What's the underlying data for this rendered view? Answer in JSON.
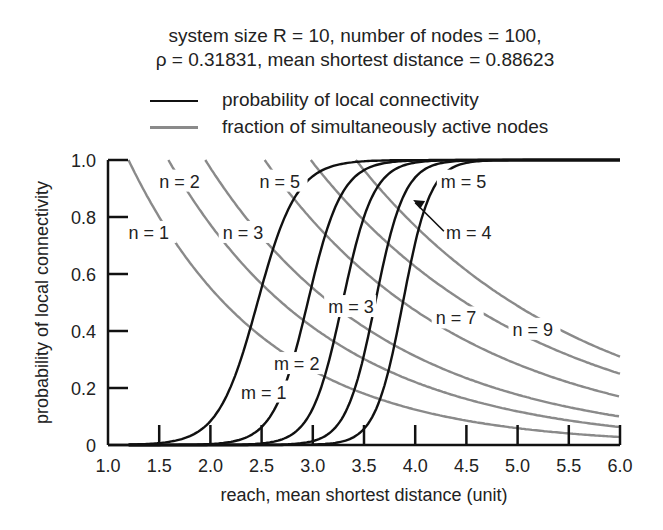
{
  "chart_data": {
    "type": "line",
    "title": "system size R = 10, number of nodes = 100,",
    "subtitle": "ρ = 0.31831, mean shortest distance = 0.88623",
    "xlabel": "reach, mean shortest distance (unit)",
    "ylabel": "probability of local connectivity",
    "xlim": [
      1.0,
      6.0
    ],
    "ylim": [
      0,
      1.0
    ],
    "xticks": [
      "1.0",
      "1.5",
      "2.0",
      "2.5",
      "3.0",
      "3.5",
      "4.0",
      "4.5",
      "5.0",
      "5.5",
      "6.0"
    ],
    "yticks": [
      "0",
      "0.2",
      "0.4",
      "0.6",
      "0.8",
      "1.0"
    ],
    "grid": false,
    "legend": [
      {
        "label": "probability of local connectivity",
        "color": "#111111"
      },
      {
        "label": "fraction of simultaneously active nodes",
        "color": "#8a8a8a"
      }
    ],
    "series_connectivity": [
      {
        "name": "m = 1",
        "midpoint": 2.46,
        "steep": 5.2
      },
      {
        "name": "m = 2",
        "midpoint": 2.95,
        "steep": 6.0
      },
      {
        "name": "m = 3",
        "midpoint": 3.29,
        "steep": 6.6
      },
      {
        "name": "m = 4",
        "midpoint": 3.61,
        "steep": 7.0
      },
      {
        "name": "m = 5",
        "midpoint": 3.88,
        "steep": 7.4
      }
    ],
    "series_active": [
      {
        "name": "n = 1",
        "x_at_1": 1.2,
        "y_at_6": 0.028
      },
      {
        "name": "n = 2",
        "x_at_1": 1.59,
        "y_at_6": 0.063
      },
      {
        "name": "n = 3",
        "x_at_1": 1.95,
        "y_at_6": 0.1
      },
      {
        "name": "n = 5",
        "x_at_1": 2.53,
        "y_at_6": 0.17
      },
      {
        "name": "n = 7",
        "x_at_1": 2.98,
        "y_at_6": 0.25
      },
      {
        "name": "n = 9",
        "x_at_1": 3.42,
        "y_at_6": 0.31
      }
    ],
    "annotations": [
      {
        "text": "n = 1",
        "x": 1.2,
        "y": 0.73
      },
      {
        "text": "n = 2",
        "x": 1.5,
        "y": 0.91
      },
      {
        "text": "n = 3",
        "x": 2.12,
        "y": 0.73
      },
      {
        "text": "n = 5",
        "x": 2.48,
        "y": 0.91
      },
      {
        "text": "n = 7",
        "x": 4.2,
        "y": 0.43
      },
      {
        "text": "n = 9",
        "x": 4.95,
        "y": 0.39
      },
      {
        "text": "m = 1",
        "x": 2.3,
        "y": 0.17
      },
      {
        "text": "m = 2",
        "x": 2.62,
        "y": 0.27
      },
      {
        "text": "m = 3",
        "x": 3.15,
        "y": 0.47
      },
      {
        "text": "m = 4",
        "x": 4.3,
        "y": 0.73
      },
      {
        "text": "m = 5",
        "x": 4.25,
        "y": 0.91
      }
    ]
  }
}
